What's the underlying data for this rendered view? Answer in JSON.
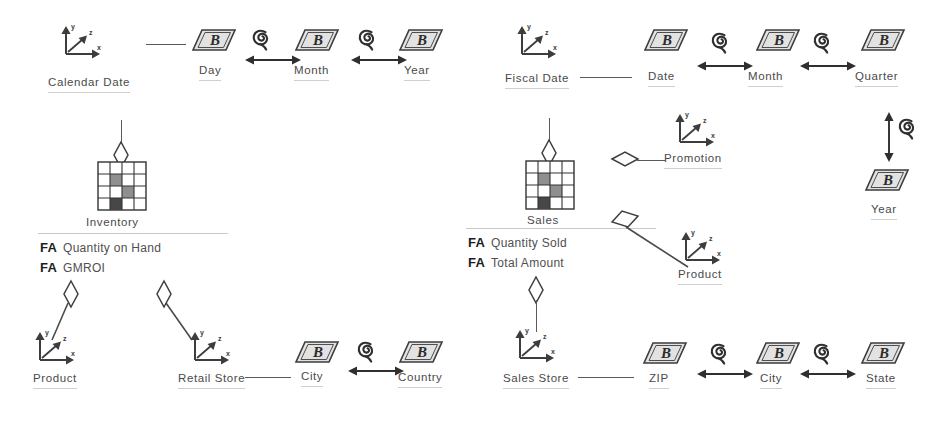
{
  "diagram": {
    "colors": {
      "stroke": "#4a4a4a",
      "label": "#4a4a4a",
      "fa_tag": "#1d1d1d",
      "underline": "#cfcfcf",
      "parallelogram_fill": "#e2e2e2",
      "cube_dark": "#575757",
      "cube_mid": "#8f8f8f",
      "cube_light": "#ffffff",
      "background": "#ffffff"
    },
    "icons": {
      "axes": "xyz-axes-icon",
      "level": "parallelogram-b-icon",
      "hierarchy": "spiral-icon",
      "bidirectional": "double-arrow-icon",
      "cube": "cube-grid-icon",
      "connector": "diamond-connector-icon"
    },
    "level_glyph_letter": "B",
    "axis_labels": {
      "x": "x",
      "y": "y",
      "z": "z"
    }
  },
  "left_model": {
    "name": "Inventory model",
    "date_dimension": {
      "name": "Calendar Date",
      "levels": [
        "Day",
        "Month",
        "Year"
      ]
    },
    "fact": {
      "name": "Inventory",
      "attributes": [
        {
          "tag": "FA",
          "name": "Quantity on Hand"
        },
        {
          "tag": "FA",
          "name": "GMROI"
        }
      ]
    },
    "dimensions": [
      {
        "name": "Product",
        "levels": []
      },
      {
        "name": "Retail Store",
        "levels": [
          "City",
          "Country"
        ]
      }
    ]
  },
  "right_model": {
    "name": "Sales model",
    "date_dimension": {
      "name": "Fiscal Date",
      "levels": [
        "Date",
        "Month",
        "Quarter"
      ]
    },
    "year_level": {
      "name": "Year"
    },
    "fact": {
      "name": "Sales",
      "attributes": [
        {
          "tag": "FA",
          "name": "Quantity Sold"
        },
        {
          "tag": "FA",
          "name": "Total Amount"
        }
      ]
    },
    "dimensions": [
      {
        "name": "Promotion",
        "levels": []
      },
      {
        "name": "Product",
        "levels": []
      },
      {
        "name": "Sales Store",
        "levels": [
          "ZIP",
          "City",
          "State"
        ]
      }
    ]
  }
}
